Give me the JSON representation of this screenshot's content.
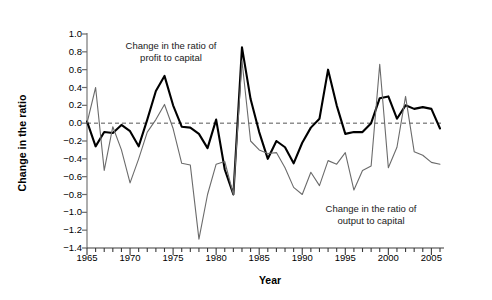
{
  "chart_data": {
    "type": "line",
    "title": "",
    "xlabel": "Year",
    "ylabel": "Change in the ratio",
    "xlim": [
      1965,
      2006
    ],
    "ylim": [
      -1.4,
      1.0
    ],
    "grid": false,
    "legend_position": "inline-annotations",
    "zero_reference_line": true,
    "yticks": [
      "1.0",
      "0.8",
      "0.6",
      "0.4",
      "0.2",
      "0.0",
      "-0.2",
      "-0.4",
      "-0.6",
      "-0.8",
      "-1.0",
      "-1.2",
      "-1.4"
    ],
    "ytick_values": [
      1.0,
      0.8,
      0.6,
      0.4,
      0.2,
      0.0,
      -0.2,
      -0.4,
      -0.6,
      -0.8,
      -1.0,
      -1.2,
      -1.4
    ],
    "xticks": [
      "1965",
      "1970",
      "1975",
      "1980",
      "1985",
      "1990",
      "1995",
      "2000",
      "2005"
    ],
    "xtick_values": [
      1965,
      1970,
      1975,
      1980,
      1985,
      1990,
      1995,
      2000,
      2005
    ],
    "x": [
      1965,
      1966,
      1967,
      1968,
      1969,
      1970,
      1971,
      1972,
      1973,
      1974,
      1975,
      1976,
      1977,
      1978,
      1979,
      1980,
      1981,
      1982,
      1983,
      1984,
      1985,
      1986,
      1987,
      1988,
      1989,
      1990,
      1991,
      1992,
      1993,
      1994,
      1995,
      1996,
      1997,
      1998,
      1999,
      2000,
      2001,
      2002,
      2003,
      2004,
      2005,
      2006
    ],
    "series": [
      {
        "name": "Change in the ratio of profit to capital",
        "color": "#000000",
        "width": 2.1,
        "annotation": "Change in the ratio of\nprofit to capital",
        "values": [
          0.02,
          -0.26,
          -0.1,
          -0.11,
          -0.02,
          -0.09,
          -0.26,
          0.04,
          0.36,
          0.53,
          0.2,
          -0.04,
          -0.05,
          -0.12,
          -0.28,
          0.04,
          -0.52,
          -0.8,
          0.85,
          0.27,
          -0.1,
          -0.4,
          -0.2,
          -0.27,
          -0.45,
          -0.22,
          -0.05,
          0.05,
          0.6,
          0.2,
          -0.12,
          -0.1,
          -0.1,
          0.0,
          0.28,
          0.3,
          0.05,
          0.2,
          0.16,
          0.18,
          0.16,
          -0.06
        ]
      },
      {
        "name": "Change in the ratio of output to capital",
        "color": "#6b6b6b",
        "width": 1.1,
        "annotation": "Change in the ratio of\noutput to capital",
        "values": [
          0.0,
          0.4,
          -0.53,
          -0.04,
          -0.3,
          -0.67,
          -0.4,
          -0.1,
          0.04,
          0.21,
          -0.06,
          -0.45,
          -0.47,
          -1.3,
          -0.8,
          -0.46,
          -0.43,
          -0.8,
          0.7,
          -0.2,
          -0.3,
          -0.34,
          -0.33,
          -0.5,
          -0.72,
          -0.8,
          -0.55,
          -0.7,
          -0.42,
          -0.46,
          -0.33,
          -0.75,
          -0.53,
          -0.48,
          0.66,
          -0.5,
          -0.27,
          0.3,
          -0.32,
          -0.36,
          -0.44,
          -0.46
        ]
      }
    ]
  },
  "axes": {
    "ylabel_text": "Change in the ratio",
    "xlabel_text": "Year"
  }
}
